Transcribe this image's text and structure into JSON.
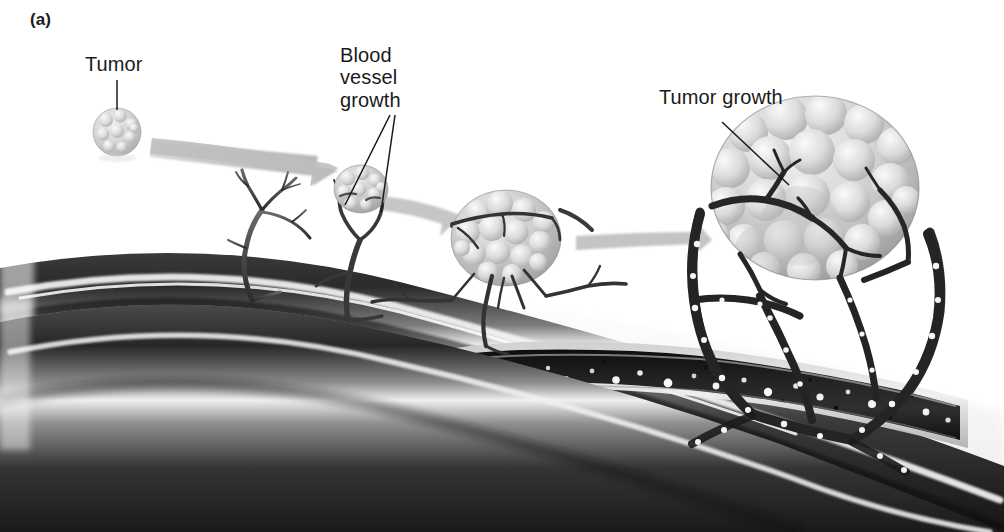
{
  "figure": {
    "panel_letter": "(a)",
    "background_color": "#ffffff",
    "width": 1004,
    "height": 532,
    "ink_color": "#1a1a1a"
  },
  "labels": {
    "tumor": "Tumor",
    "blood_vessel_growth": "Blood\nvessel\ngrowth",
    "tumor_growth": "Tumor growth"
  },
  "leaders": {
    "tumor_leader": "vertical line from Tumor label down to small tumor",
    "bvg_leader_left": "line from Blood vessel growth label down-left to vessel sprout",
    "bvg_leader_right": "line from Blood vessel growth label down to vessel stalk",
    "tumor_growth_leader": "line from Tumor growth label down-right to large tumor"
  },
  "stages": [
    {
      "name": "stage-1-avascular-tumor",
      "caption": "Tumor",
      "tumor_radius": 23,
      "vascularized": false,
      "tumor_fill": "#d8d8d8"
    },
    {
      "name": "stage-2-vessel-sprouting",
      "caption": "Blood vessel growth",
      "tumor_radius": 26,
      "vascularized": true,
      "tumor_fill": "#c9c9c9"
    },
    {
      "name": "stage-3-vascularized-tumor",
      "caption": "",
      "tumor_radius": 52,
      "vascularized": true,
      "tumor_fill": "#c4c4c4"
    },
    {
      "name": "stage-4-tumor-growth",
      "caption": "Tumor growth",
      "tumor_radius": 100,
      "vascularized": true,
      "tumor_fill": "#c9c9c9"
    }
  ],
  "arrows": {
    "count": 3,
    "color": "#b9b9b9",
    "style": "tapered gray progression arrow"
  },
  "blood_vessel": {
    "name": "main blood vessel",
    "outer_color": "#2e2e2e",
    "highlight_color": "#f2f2f2",
    "lumen_color": "#1d1d1d",
    "cutaway": true,
    "blood_cells_visible": true,
    "cell_color_light": "#f5f5f5",
    "cell_color_dark": "#101010"
  },
  "palette": {
    "background": "#ffffff",
    "ink": "#1a1a1a",
    "arrow_gray": "#b9b9b9",
    "vessel_dark": "#2e2e2e",
    "tumor_light": "#d4d4d4",
    "ground_shadow": "#e9e9e9"
  }
}
